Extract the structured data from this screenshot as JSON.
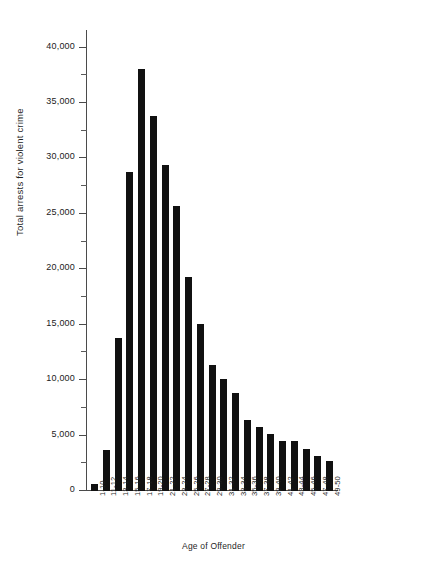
{
  "chart_data": {
    "type": "bar",
    "title": "",
    "xlabel": "Age of Offender",
    "ylabel": "Total arrests for violent crime",
    "categories": [
      "1-10",
      "11-12",
      "13-14",
      "15-16",
      "17-18",
      "19-20",
      "21-22",
      "23-24",
      "25-26",
      "27-28",
      "29-30",
      "31-32",
      "33-34",
      "35-36",
      "37-38",
      "39-40",
      "41-42",
      "43-44",
      "45-46",
      "47-48",
      "49-50"
    ],
    "values": [
      600,
      3700,
      13800,
      28800,
      38100,
      33800,
      29400,
      25700,
      19300,
      15100,
      11400,
      10100,
      8800,
      6400,
      5800,
      5100,
      4500,
      4500,
      3800,
      3200,
      2700
    ],
    "ylim": [
      0,
      41500
    ],
    "y_major_ticks": [
      0,
      5000,
      10000,
      15000,
      20000,
      25000,
      30000,
      35000,
      40000
    ],
    "y_major_tick_labels": [
      "0",
      "5,000",
      "10,000",
      "15,000",
      "20,000",
      "25,000",
      "30,000",
      "35,000",
      "40,000"
    ],
    "y_minor_ticks": [
      2500,
      7500,
      12500,
      17500,
      22500,
      27500,
      32500,
      37500
    ],
    "grid": false,
    "legend": "none",
    "bar_color": "#111111",
    "axis_color": "#4b4b4b",
    "background_color": "#ffffff"
  }
}
